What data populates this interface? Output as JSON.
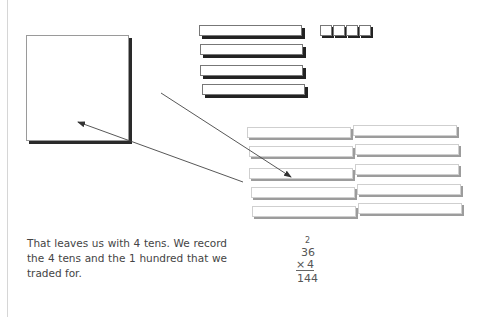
{
  "figure": {
    "hundreds_flats": 1,
    "dark_tens_rods": 4,
    "dark_unit_cubes": 4,
    "traded_tens_rods": 10,
    "arrows": [
      {
        "from": [
          161,
          93
        ],
        "to": [
          291,
          177
        ],
        "label": "trade-to-tens"
      },
      {
        "from": [
          243,
          182
        ],
        "to": [
          78,
          122
        ],
        "label": "trade-to-hundred"
      }
    ],
    "colors": {
      "dark_shadow": "#222222",
      "gray_shadow": "#9c9c9c",
      "text": "#444444",
      "margin_rule": "#d6d6d6"
    }
  },
  "caption": {
    "text": "That leaves us with 4 tens. We record the 4 tens and the 1 hundred that we traded for."
  },
  "math": {
    "carry": "2",
    "multiplicand": "36",
    "operator": "×",
    "multiplier": "4",
    "product": "144"
  }
}
